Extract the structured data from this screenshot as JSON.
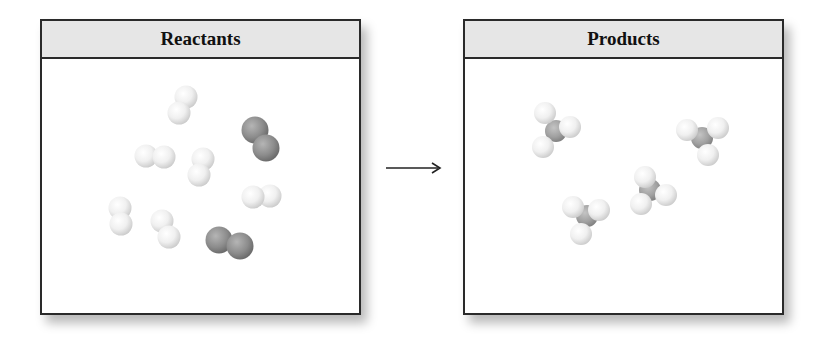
{
  "reactants_panel": {
    "title": "Reactants",
    "molecules": [
      {
        "type": "H2",
        "atoms": [
          {
            "el": "H",
            "x": 186,
            "y": 97
          },
          {
            "el": "H",
            "x": 179,
            "y": 113
          }
        ]
      },
      {
        "type": "N2",
        "atoms": [
          {
            "el": "N",
            "x": 255,
            "y": 130
          },
          {
            "el": "N",
            "x": 266,
            "y": 148
          }
        ]
      },
      {
        "type": "H2",
        "atoms": [
          {
            "el": "H",
            "x": 146,
            "y": 156
          },
          {
            "el": "H",
            "x": 164,
            "y": 157
          }
        ]
      },
      {
        "type": "H2",
        "atoms": [
          {
            "el": "H",
            "x": 203,
            "y": 159
          },
          {
            "el": "H",
            "x": 199,
            "y": 175
          }
        ]
      },
      {
        "type": "H2",
        "atoms": [
          {
            "el": "H",
            "x": 270,
            "y": 196
          },
          {
            "el": "H",
            "x": 253,
            "y": 197
          }
        ]
      },
      {
        "type": "H2",
        "atoms": [
          {
            "el": "H",
            "x": 120,
            "y": 208
          },
          {
            "el": "H",
            "x": 121,
            "y": 224
          }
        ]
      },
      {
        "type": "H2",
        "atoms": [
          {
            "el": "H",
            "x": 162,
            "y": 221
          },
          {
            "el": "H",
            "x": 169,
            "y": 237
          }
        ]
      },
      {
        "type": "N2",
        "atoms": [
          {
            "el": "N",
            "x": 219,
            "y": 240
          },
          {
            "el": "N",
            "x": 240,
            "y": 246
          }
        ]
      }
    ]
  },
  "arrow": {
    "direction": "right",
    "meaning": "yields"
  },
  "products_panel": {
    "title": "Products",
    "molecules": [
      {
        "type": "NH3",
        "atoms": [
          {
            "el": "H",
            "x": 570,
            "y": 127
          },
          {
            "el": "N",
            "x": 556,
            "y": 131
          },
          {
            "el": "H",
            "x": 545,
            "y": 113
          },
          {
            "el": "H",
            "x": 543,
            "y": 147
          }
        ]
      },
      {
        "type": "NH3",
        "atoms": [
          {
            "el": "H",
            "x": 687,
            "y": 130
          },
          {
            "el": "N",
            "x": 702,
            "y": 138
          },
          {
            "el": "H",
            "x": 718,
            "y": 128
          },
          {
            "el": "H",
            "x": 708,
            "y": 155
          }
        ]
      },
      {
        "type": "NH3",
        "atoms": [
          {
            "el": "H",
            "x": 645,
            "y": 177
          },
          {
            "el": "N",
            "x": 650,
            "y": 190
          },
          {
            "el": "H",
            "x": 666,
            "y": 195
          },
          {
            "el": "H",
            "x": 641,
            "y": 204
          }
        ]
      },
      {
        "type": "NH3",
        "atoms": [
          {
            "el": "H",
            "x": 573,
            "y": 207
          },
          {
            "el": "H",
            "x": 599,
            "y": 210
          },
          {
            "el": "N",
            "x": 587,
            "y": 216
          },
          {
            "el": "H",
            "x": 581,
            "y": 234
          }
        ]
      }
    ]
  },
  "legend_colors": {
    "hydrogen": "#f2f2f2",
    "nitrogen": "#8f8f8f",
    "header_bg": "#e6e6e6",
    "border": "#2a2a2a"
  }
}
